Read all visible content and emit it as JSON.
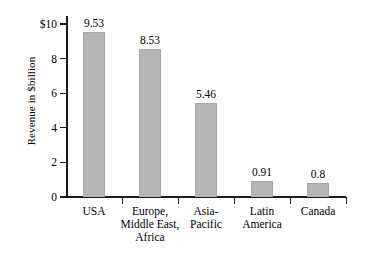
{
  "chart_data": {
    "type": "bar",
    "title": "",
    "xlabel": "",
    "ylabel": "Revenue in $billion",
    "categories": [
      "USA",
      "Europe, Middle East, Africa",
      "Asia-Pacific",
      "Latin America",
      "Canada"
    ],
    "category_lines": [
      [
        "USA"
      ],
      [
        "Europe,",
        "Middle East,",
        "Africa"
      ],
      [
        "Asia-",
        "Pacific"
      ],
      [
        "Latin",
        "America"
      ],
      [
        "Canada"
      ]
    ],
    "values": [
      9.53,
      8.53,
      5.46,
      0.91,
      0.8
    ],
    "value_labels": [
      "9.53",
      "8.53",
      "5.46",
      "0.91",
      "0.8"
    ],
    "ylim": [
      0,
      10
    ],
    "yticks": [
      0,
      2,
      4,
      6,
      8,
      10
    ],
    "ytick_labels": [
      "0",
      "2",
      "4",
      "6",
      "8",
      "$10"
    ],
    "grid": false,
    "legend": null,
    "bar_color": "#b5b5b5",
    "axis_color": "#1a1a1a",
    "text_color": "#000000"
  }
}
